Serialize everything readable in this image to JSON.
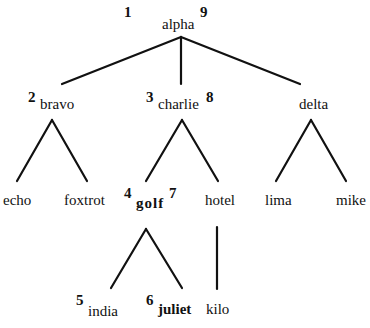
{
  "diagram": {
    "type": "tree",
    "nodes": [
      {
        "id": "alpha",
        "label": "alpha",
        "pre": "1",
        "post": "9",
        "bold": false
      },
      {
        "id": "bravo",
        "label": "bravo",
        "pre": "2",
        "post": "",
        "bold": false
      },
      {
        "id": "charlie",
        "label": "charlie",
        "pre": "3",
        "post": "8",
        "bold": false
      },
      {
        "id": "delta",
        "label": "delta",
        "pre": "",
        "post": "",
        "bold": false
      },
      {
        "id": "echo",
        "label": "echo",
        "pre": "",
        "post": "",
        "bold": false
      },
      {
        "id": "foxtrot",
        "label": "foxtrot",
        "pre": "",
        "post": "",
        "bold": false
      },
      {
        "id": "golf",
        "label": "golf",
        "pre": "4",
        "post": "7",
        "bold": true
      },
      {
        "id": "hotel",
        "label": "hotel",
        "pre": "",
        "post": "",
        "bold": false
      },
      {
        "id": "lima",
        "label": "lima",
        "pre": "",
        "post": "",
        "bold": false
      },
      {
        "id": "mike",
        "label": "mike",
        "pre": "",
        "post": "",
        "bold": false
      },
      {
        "id": "india",
        "label": "india",
        "pre": "5",
        "post": "",
        "bold": false
      },
      {
        "id": "juliet",
        "label": "juliet",
        "pre": "6",
        "post": "",
        "bold": true
      },
      {
        "id": "kilo",
        "label": "kilo",
        "pre": "",
        "post": "",
        "bold": false
      }
    ],
    "edges": [
      [
        "alpha",
        "bravo"
      ],
      [
        "alpha",
        "charlie"
      ],
      [
        "alpha",
        "delta"
      ],
      [
        "bravo",
        "echo"
      ],
      [
        "bravo",
        "foxtrot"
      ],
      [
        "charlie",
        "golf"
      ],
      [
        "charlie",
        "hotel"
      ],
      [
        "delta",
        "lima"
      ],
      [
        "delta",
        "mike"
      ],
      [
        "golf",
        "india"
      ],
      [
        "golf",
        "juliet"
      ],
      [
        "hotel",
        "kilo"
      ]
    ]
  }
}
